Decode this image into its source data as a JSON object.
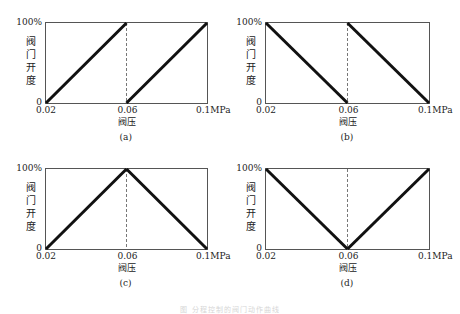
{
  "figure_caption": "图 分程控制的阀门动作曲线",
  "chart_data": [
    {
      "type": "line",
      "id": "a",
      "panel_label": "(a)",
      "xlabel": "阀压",
      "ylabel": "阀门开度",
      "x_ticks": [
        "0.02",
        "0.06",
        "0.1MPa"
      ],
      "y_ticks": [
        "0",
        "100%"
      ],
      "xlim": [
        0.02,
        0.1
      ],
      "ylim": [
        0,
        100
      ],
      "divider_x": 0.06,
      "series": [
        {
          "name": "阀A",
          "x": [
            0.02,
            0.06
          ],
          "y": [
            0,
            100
          ]
        },
        {
          "name": "阀B",
          "x": [
            0.06,
            0.1
          ],
          "y": [
            0,
            100
          ]
        }
      ]
    },
    {
      "type": "line",
      "id": "b",
      "panel_label": "(b)",
      "xlabel": "阀压",
      "ylabel": "阀门开度",
      "x_ticks": [
        "0.02",
        "0.06",
        "0.1MPa"
      ],
      "y_ticks": [
        "0",
        "100%"
      ],
      "xlim": [
        0.02,
        0.1
      ],
      "ylim": [
        0,
        100
      ],
      "divider_x": 0.06,
      "series": [
        {
          "name": "阀A",
          "x": [
            0.02,
            0.06
          ],
          "y": [
            100,
            0
          ]
        },
        {
          "name": "阀B",
          "x": [
            0.06,
            0.1
          ],
          "y": [
            100,
            0
          ]
        }
      ]
    },
    {
      "type": "line",
      "id": "c",
      "panel_label": "(c)",
      "xlabel": "阀压",
      "ylabel": "阀门开度",
      "x_ticks": [
        "0.02",
        "0.06",
        "0.1MPa"
      ],
      "y_ticks": [
        "0",
        "100%"
      ],
      "xlim": [
        0.02,
        0.1
      ],
      "ylim": [
        0,
        100
      ],
      "divider_x": 0.06,
      "series": [
        {
          "name": "阀A",
          "x": [
            0.02,
            0.06
          ],
          "y": [
            0,
            100
          ]
        },
        {
          "name": "阀B",
          "x": [
            0.06,
            0.1
          ],
          "y": [
            100,
            0
          ]
        }
      ]
    },
    {
      "type": "line",
      "id": "d",
      "panel_label": "(d)",
      "xlabel": "阀压",
      "ylabel": "阀门开度",
      "x_ticks": [
        "0.02",
        "0.06",
        "0.1MPa"
      ],
      "y_ticks": [
        "0",
        "100%"
      ],
      "xlim": [
        0.02,
        0.1
      ],
      "ylim": [
        0,
        100
      ],
      "divider_x": 0.06,
      "series": [
        {
          "name": "阀A",
          "x": [
            0.02,
            0.06
          ],
          "y": [
            100,
            0
          ]
        },
        {
          "name": "阀B",
          "x": [
            0.06,
            0.1
          ],
          "y": [
            0,
            100
          ]
        }
      ]
    }
  ],
  "style": {
    "line_color": "#111111",
    "frame_color": "#555555",
    "divider_color": "#777777"
  }
}
